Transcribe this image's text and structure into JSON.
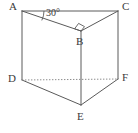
{
  "figure": {
    "kind": "triangular-prism-geometry-diagram",
    "vertex_labels": {
      "a": "A",
      "b": "B",
      "c": "C",
      "d": "D",
      "e": "E",
      "f": "F"
    },
    "angle_label": "30°",
    "marks": {
      "right_angle_at": "B",
      "hidden_edge": "DF"
    },
    "colors": {
      "stroke_solid": "#5a5a5a",
      "stroke_hidden": "#8d8d8d",
      "label_text": "#3b3b3b",
      "background": "#ffffff"
    },
    "geometry": {
      "a": [
        22,
        11
      ],
      "b": [
        81,
        31
      ],
      "c": [
        118,
        11
      ],
      "d": [
        22,
        80
      ],
      "e": [
        81,
        105
      ],
      "f": [
        118,
        79
      ]
    }
  }
}
